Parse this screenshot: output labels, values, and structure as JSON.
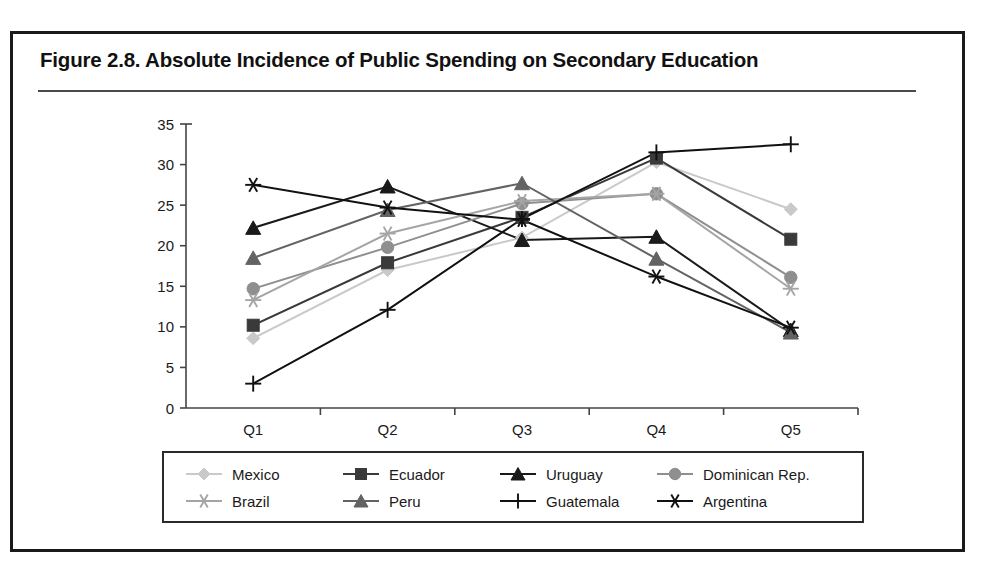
{
  "figure": {
    "title": "Figure 2.8.  Absolute Incidence of Public Spending on Secondary Education"
  },
  "chart_data": {
    "type": "line",
    "title": "Figure 2.8.  Absolute Incidence of Public Spending on Secondary Education",
    "xlabel": "",
    "ylabel": "",
    "categories": [
      "Q1",
      "Q2",
      "Q3",
      "Q4",
      "Q5"
    ],
    "ylim": [
      0,
      35
    ],
    "yticks": [
      0,
      5,
      10,
      15,
      20,
      25,
      30,
      35
    ],
    "grid": false,
    "legend_position": "bottom",
    "series": [
      {
        "name": "Mexico",
        "values": [
          8.6,
          17.0,
          21.0,
          30.3,
          24.5
        ],
        "marker": "diamond",
        "color": "#c9c9c9"
      },
      {
        "name": "Ecuador",
        "values": [
          10.2,
          17.9,
          23.5,
          30.8,
          20.8
        ],
        "marker": "square",
        "color": "#3a3a3a"
      },
      {
        "name": "Uruguay",
        "values": [
          22.2,
          27.3,
          20.7,
          21.1,
          9.6
        ],
        "marker": "triangle",
        "color": "#1a1a1a"
      },
      {
        "name": "Dominican Rep.",
        "values": [
          14.7,
          19.8,
          25.2,
          26.4,
          16.1
        ],
        "marker": "circle",
        "color": "#8f8f8f"
      },
      {
        "name": "Brazil",
        "values": [
          13.3,
          21.5,
          25.5,
          26.4,
          14.7
        ],
        "marker": "star",
        "color": "#a5a5a5"
      },
      {
        "name": "Peru",
        "values": [
          18.5,
          24.4,
          27.7,
          18.4,
          9.3
        ],
        "marker": "triangle",
        "color": "#636363"
      },
      {
        "name": "Guatemala",
        "values": [
          3.0,
          12.1,
          23.3,
          31.5,
          32.5
        ],
        "marker": "plus",
        "color": "#111111"
      },
      {
        "name": "Argentina",
        "values": [
          27.5,
          24.7,
          23.2,
          16.2,
          9.9
        ],
        "marker": "star",
        "color": "#111111"
      }
    ]
  },
  "legend": {
    "rows": [
      [
        "Mexico",
        "Ecuador",
        "Uruguay",
        "Dominican Rep."
      ],
      [
        "Brazil",
        "Peru",
        "Guatemala",
        "Argentina"
      ]
    ]
  }
}
